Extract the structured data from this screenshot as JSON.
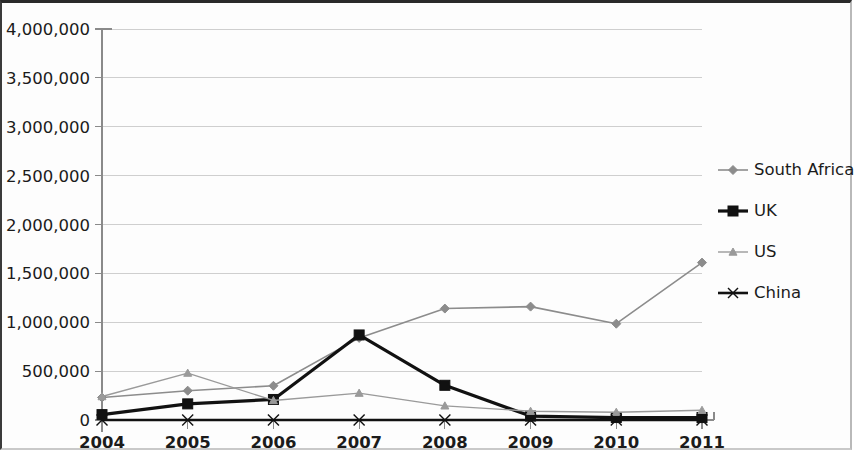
{
  "chart_data": {
    "type": "line",
    "title": "",
    "subtitle": "",
    "xlabel": "",
    "ylabel": "",
    "categories": [
      "2004",
      "2005",
      "2006",
      "2007",
      "2008",
      "2009",
      "2010",
      "2011"
    ],
    "x": [
      2004,
      2005,
      2006,
      2007,
      2008,
      2009,
      2010,
      2011
    ],
    "ylim": [
      0,
      4000000
    ],
    "xlim": [
      2004,
      2011
    ],
    "ytick_labels": [
      "0",
      "500,000",
      "1,000,000",
      "1,500,000",
      "2,000,000",
      "2,500,000",
      "3,000,000",
      "3,500,000",
      "4,000,000"
    ],
    "ytick_values": [
      0,
      500000,
      1000000,
      1500000,
      2000000,
      2500000,
      3000000,
      3500000,
      4000000
    ],
    "grid": true,
    "grid_axis": "y",
    "legend_position": "right",
    "series": [
      {
        "name": "South Africa",
        "marker": "diamond",
        "color": "#8c8c8c",
        "line_width": 1.6,
        "values": [
          230000,
          300000,
          350000,
          840000,
          1140000,
          1160000,
          985000,
          1610000
        ]
      },
      {
        "name": "UK",
        "marker": "square",
        "color": "#111111",
        "line_width": 3.2,
        "values": [
          55000,
          165000,
          210000,
          870000,
          355000,
          40000,
          25000,
          25000
        ]
      },
      {
        "name": "US",
        "marker": "triangle",
        "color": "#9a9a9a",
        "line_width": 1.4,
        "values": [
          240000,
          480000,
          200000,
          275000,
          145000,
          90000,
          80000,
          100000
        ]
      },
      {
        "name": "China",
        "marker": "x",
        "color": "#111111",
        "line_width": 2.6,
        "values": [
          0,
          0,
          0,
          0,
          0,
          0,
          0,
          0
        ]
      }
    ]
  },
  "axes": {
    "plot_left": 100,
    "plot_right": 700,
    "plot_top": 26,
    "plot_bottom": 417
  },
  "legend": {
    "entries": [
      "South Africa",
      "UK",
      "US",
      "China"
    ]
  }
}
